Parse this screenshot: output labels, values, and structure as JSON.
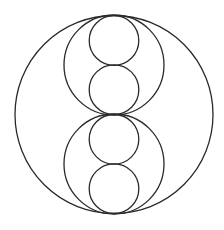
{
  "diagram": {
    "stroke_color": "#2a2a2a",
    "background": "#ffffff",
    "circles": [
      {
        "role": "outer",
        "cx": 114,
        "cy": 114.5,
        "r": 99
      },
      {
        "role": "medium-top",
        "cx": 114,
        "cy": 65,
        "r": 50
      },
      {
        "role": "medium-bottom",
        "cx": 114,
        "cy": 164,
        "r": 50
      },
      {
        "role": "small-1",
        "cx": 114,
        "cy": 40.5,
        "r": 24.8
      },
      {
        "role": "small-2",
        "cx": 114,
        "cy": 89.7,
        "r": 24.8
      },
      {
        "role": "small-3",
        "cx": 114,
        "cy": 139.3,
        "r": 24.8
      },
      {
        "role": "small-4",
        "cx": 114,
        "cy": 188.7,
        "r": 24.8
      }
    ]
  }
}
